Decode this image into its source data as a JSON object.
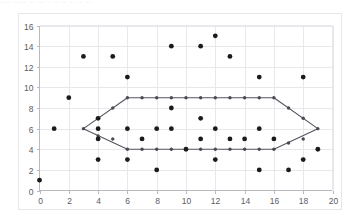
{
  "top_strip": {
    "text": "···  ····  ·· ·· · ·  ··    ·· · ··"
  },
  "colors": {
    "background": "#ffffff",
    "panel_border": "#e6e6e9",
    "gridline": "#e8e8ec",
    "axis": "#b9b9c0",
    "point": "#1b1b1b",
    "hull_stroke": "#555560",
    "hull_vertex": "#4a4a55",
    "tick_text": "#5b5b66"
  },
  "chart_data": {
    "type": "scatter",
    "title": "",
    "xlabel": "",
    "ylabel": "",
    "xlim": [
      0,
      20
    ],
    "ylim": [
      0,
      16
    ],
    "xticks": [
      0,
      2,
      4,
      6,
      8,
      10,
      12,
      14,
      16,
      18,
      20
    ],
    "yticks": [
      0,
      2,
      4,
      6,
      8,
      10,
      12,
      14,
      16
    ],
    "grid": true,
    "legend": "none",
    "series": [
      {
        "name": "points",
        "marker": "circle",
        "color": "#1b1b1b",
        "points": [
          [
            0,
            1
          ],
          [
            1,
            6
          ],
          [
            2,
            9
          ],
          [
            3,
            13
          ],
          [
            4,
            3
          ],
          [
            4,
            5
          ],
          [
            4,
            6
          ],
          [
            4,
            7
          ],
          [
            5,
            13
          ],
          [
            6,
            11
          ],
          [
            6,
            3
          ],
          [
            6,
            6
          ],
          [
            7,
            5
          ],
          [
            8,
            6
          ],
          [
            8,
            2
          ],
          [
            9,
            14
          ],
          [
            9,
            8
          ],
          [
            9,
            6
          ],
          [
            10,
            4
          ],
          [
            11,
            14
          ],
          [
            11,
            7
          ],
          [
            11,
            5
          ],
          [
            12,
            15
          ],
          [
            12,
            6
          ],
          [
            12,
            3
          ],
          [
            13,
            13
          ],
          [
            13,
            5
          ],
          [
            14,
            5
          ],
          [
            15,
            11
          ],
          [
            15,
            6
          ],
          [
            15,
            2
          ],
          [
            16,
            5
          ],
          [
            17,
            2
          ],
          [
            18,
            11
          ],
          [
            18,
            3
          ],
          [
            19,
            4
          ]
        ]
      }
    ],
    "hull": {
      "name": "convex-hull",
      "closed": true,
      "stroke": "#555560",
      "vertices": [
        [
          3,
          6
        ],
        [
          6,
          9
        ],
        [
          16,
          9
        ],
        [
          19,
          6
        ],
        [
          16,
          4
        ],
        [
          6,
          4
        ]
      ],
      "edge_markers": [
        [
          3,
          6
        ],
        [
          4,
          7
        ],
        [
          5,
          8
        ],
        [
          6,
          9
        ],
        [
          7,
          9
        ],
        [
          8,
          9
        ],
        [
          9,
          9
        ],
        [
          10,
          9
        ],
        [
          11,
          9
        ],
        [
          12,
          9
        ],
        [
          13,
          9
        ],
        [
          14,
          9
        ],
        [
          15,
          9
        ],
        [
          16,
          9
        ],
        [
          17,
          8
        ],
        [
          18,
          7
        ],
        [
          19,
          6
        ],
        [
          18,
          5
        ],
        [
          17,
          4.6
        ],
        [
          16,
          4
        ],
        [
          15,
          4
        ],
        [
          14,
          4
        ],
        [
          13,
          4
        ],
        [
          12,
          4
        ],
        [
          11,
          4
        ],
        [
          10,
          4
        ],
        [
          9,
          4
        ],
        [
          8,
          4
        ],
        [
          7,
          4
        ],
        [
          6,
          4
        ],
        [
          5,
          5
        ],
        [
          4,
          5.3
        ]
      ]
    }
  }
}
